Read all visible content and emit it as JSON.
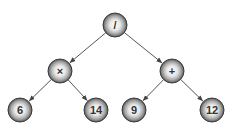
{
  "diagram": {
    "type": "expression-tree",
    "nodes": [
      {
        "id": "root",
        "label": "/",
        "x": 115,
        "y": 25
      },
      {
        "id": "mul",
        "label": "×",
        "x": 60,
        "y": 71
      },
      {
        "id": "add",
        "label": "+",
        "x": 172,
        "y": 71
      },
      {
        "id": "n6",
        "label": "6",
        "x": 20,
        "y": 110
      },
      {
        "id": "n14",
        "label": "14",
        "x": 96,
        "y": 110
      },
      {
        "id": "n9",
        "label": "9",
        "x": 134,
        "y": 110
      },
      {
        "id": "n12",
        "label": "12",
        "x": 212,
        "y": 110
      }
    ],
    "edges": [
      {
        "from": "root",
        "to": "mul"
      },
      {
        "from": "root",
        "to": "add"
      },
      {
        "from": "mul",
        "to": "n6"
      },
      {
        "from": "mul",
        "to": "n14"
      },
      {
        "from": "add",
        "to": "n9"
      },
      {
        "from": "add",
        "to": "n12"
      }
    ],
    "colors": {
      "edge": "#555555",
      "node_fill_light": "#f2f2f2",
      "node_fill_dark": "#6a6a6a",
      "text": "#333333"
    }
  }
}
